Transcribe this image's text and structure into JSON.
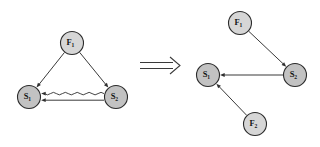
{
  "figure": {
    "background_color": "#ffffff",
    "relation_symbol": "implies-double-arrow",
    "node_fill_f": "#d6d6d6",
    "node_fill_s": "#c2c2c2",
    "node_stroke": "#2b2b2b",
    "edge_color": "#2f2f2f"
  },
  "left_graph": {
    "name": "before-graph",
    "nodes": [
      {
        "id": "F1",
        "label": "F",
        "subscript": "1",
        "kind": "F",
        "cx": 72,
        "cy": 43,
        "r": 11.5
      },
      {
        "id": "S1",
        "label": "S",
        "subscript": "1",
        "kind": "S",
        "cx": 29,
        "cy": 97,
        "r": 11.5
      },
      {
        "id": "S2",
        "label": "S",
        "subscript": "2",
        "kind": "S",
        "cx": 116,
        "cy": 97,
        "r": 11.5
      }
    ],
    "edges": [
      {
        "id": "F1-S1",
        "from": "F1",
        "to": "S1",
        "style": "straight",
        "arrow": "to"
      },
      {
        "id": "F1-S2",
        "from": "F1",
        "to": "S2",
        "style": "straight",
        "arrow": "to"
      },
      {
        "id": "S2-S1-straight",
        "from": "S2",
        "to": "S1",
        "style": "straight",
        "arrow": "to"
      },
      {
        "id": "S2-S1-wavy",
        "from": "S2",
        "to": "S1",
        "style": "wavy",
        "arrow": "to"
      }
    ]
  },
  "right_graph": {
    "name": "after-graph",
    "nodes": [
      {
        "id": "F1",
        "label": "F",
        "subscript": "1",
        "kind": "F",
        "cx": 240,
        "cy": 23,
        "r": 11.5
      },
      {
        "id": "S2",
        "label": "S",
        "subscript": "2",
        "kind": "S",
        "cx": 295,
        "cy": 75,
        "r": 11.5
      },
      {
        "id": "S1",
        "label": "S",
        "subscript": "1",
        "kind": "S",
        "cx": 208,
        "cy": 75,
        "r": 11.5
      },
      {
        "id": "F2",
        "label": "F",
        "subscript": "2",
        "kind": "F",
        "cx": 255,
        "cy": 124,
        "r": 11.5
      }
    ],
    "edges": [
      {
        "id": "F1-S2",
        "from": "F1",
        "to": "S2",
        "style": "straight",
        "arrow": "to"
      },
      {
        "id": "S2-S1",
        "from": "S2",
        "to": "S1",
        "style": "straight",
        "arrow": "to"
      },
      {
        "id": "F2-S1",
        "from": "F2",
        "to": "S1",
        "style": "straight",
        "arrow": "to"
      }
    ]
  }
}
